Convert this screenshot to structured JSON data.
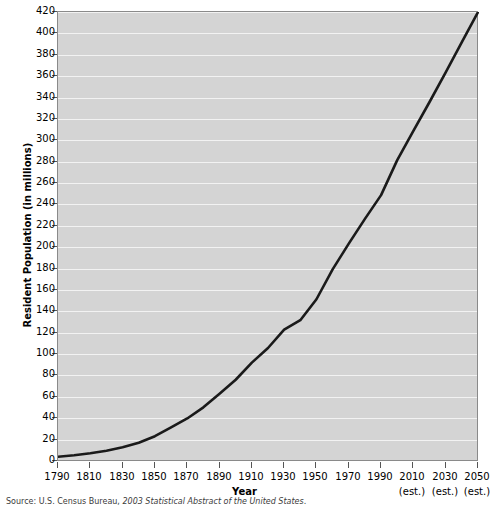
{
  "chart_data": {
    "type": "line",
    "title": "",
    "xlabel": "Year",
    "ylabel": "Resident Population (in millions)",
    "xlim": [
      1790,
      2050
    ],
    "ylim": [
      0,
      420
    ],
    "grid": true,
    "legend": null,
    "x_ticks": [
      1790,
      1810,
      1830,
      1850,
      1870,
      1890,
      1910,
      1930,
      1950,
      1970,
      1990,
      2010,
      2030,
      2050
    ],
    "x_tick_labels": [
      "1790",
      "1810",
      "1830",
      "1850",
      "1870",
      "1890",
      "1910",
      "1930",
      "1950",
      "1970",
      "1990",
      "2010",
      "2030",
      "2050"
    ],
    "x_tick_sublabels": [
      "",
      "",
      "",
      "",
      "",
      "",
      "",
      "",
      "",
      "",
      "",
      "(est.)",
      "(est.)",
      "(est.)"
    ],
    "y_ticks": [
      0,
      20,
      40,
      60,
      80,
      100,
      120,
      140,
      160,
      180,
      200,
      220,
      240,
      260,
      280,
      300,
      320,
      340,
      360,
      380,
      400,
      420
    ],
    "y_tick_labels": [
      "0",
      "20",
      "40",
      "60",
      "80",
      "100",
      "120",
      "140",
      "160",
      "180",
      "200",
      "220",
      "240",
      "260",
      "280",
      "300",
      "320",
      "340",
      "360",
      "380",
      "400",
      "420"
    ],
    "series": [
      {
        "name": "Resident Population",
        "color": "#1a1a1a",
        "x": [
          1790,
          1800,
          1810,
          1820,
          1830,
          1840,
          1850,
          1860,
          1870,
          1880,
          1890,
          1900,
          1910,
          1920,
          1930,
          1940,
          1950,
          1960,
          1970,
          1980,
          1990,
          2000,
          2010,
          2020,
          2030,
          2040,
          2050
        ],
        "values": [
          3.9,
          5.3,
          7.2,
          9.6,
          12.9,
          17.1,
          23.2,
          31.4,
          39.8,
          50.2,
          62.9,
          76.0,
          92.0,
          105.7,
          122.8,
          131.7,
          151.3,
          179.3,
          203.3,
          226.5,
          248.7,
          281.4,
          308.9,
          335.8,
          363.6,
          391.9,
          419.9
        ]
      }
    ]
  },
  "axes": {
    "x_axis_title": "Year",
    "y_axis_title": "Resident Population (in millions)"
  },
  "footnote": {
    "source_prefix": "Source: U.S. Census Bureau, ",
    "source_italic": "2003 Statistical Abstract of the United States",
    "source_suffix": "."
  },
  "colors": {
    "plot_background": "#d4d4d4",
    "gridline": "#f2f2f2",
    "line": "#1a1a1a",
    "axis": "#555555",
    "text": "#000000"
  }
}
